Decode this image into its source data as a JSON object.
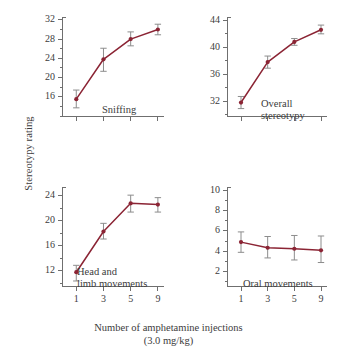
{
  "figure": {
    "shared_xlabel_line1": "Number of amphetamine injections",
    "shared_xlabel_line2": "(3.0 mg/kg)",
    "shared_ylabel": "Stereotypy rating",
    "background": "#ffffff",
    "series_color": "#8b2434",
    "errorbar_color": "#8c8c8c",
    "axis_color": "#6f6f6f"
  },
  "chart_data": [
    {
      "type": "line",
      "title": "Sniffing",
      "panel": "top-left",
      "xlabel": "Number of amphetamine injections (3.0 mg/kg)",
      "ylabel": "Stereotypy rating",
      "x": [
        1,
        3,
        5,
        9
      ],
      "categories": [
        "1",
        "3",
        "5",
        "9"
      ],
      "xtick_labels_visible": false,
      "values": [
        15.5,
        23.8,
        28.0,
        30.0
      ],
      "errors_upper": [
        1.9,
        2.3,
        1.5,
        1.1
      ],
      "errors_lower": [
        1.8,
        2.5,
        1.4,
        1.1
      ],
      "ylim": [
        12.0,
        32.6
      ],
      "yticks": [
        16,
        20,
        24,
        28,
        32
      ],
      "yminor_step": 2,
      "grid": false,
      "legend": "none",
      "marker": "filled-circle"
    },
    {
      "type": "line",
      "title": "Overall stereotypy",
      "title_line1": "Overall",
      "title_line2": "stereotypy",
      "panel": "top-right",
      "xlabel": "Number of amphetamine injections (3.0 mg/kg)",
      "ylabel": "Stereotypy rating",
      "x": [
        1,
        3,
        5,
        9
      ],
      "categories": [
        "1",
        "3",
        "5",
        "9"
      ],
      "xtick_labels_visible": false,
      "values": [
        31.8,
        37.8,
        40.8,
        42.6
      ],
      "errors_upper": [
        0.9,
        0.9,
        0.5,
        0.7
      ],
      "errors_lower": [
        0.9,
        0.9,
        0.5,
        0.6
      ],
      "ylim": [
        29.8,
        44.5
      ],
      "yticks": [
        32,
        36,
        40,
        44
      ],
      "yminor_step": 2,
      "grid": false,
      "legend": "none",
      "marker": "filled-circle"
    },
    {
      "type": "line",
      "title": "Head and limb movements",
      "title_line1": "Head and",
      "title_line2": "limb movements",
      "panel": "bottom-left",
      "xlabel": "Number of amphetamine injections (3.0 mg/kg)",
      "ylabel": "Stereotypy rating",
      "x": [
        1,
        3,
        5,
        9
      ],
      "categories": [
        "1",
        "3",
        "5",
        "9"
      ],
      "xtick_labels_visible": true,
      "values": [
        11.8,
        18.3,
        22.8,
        22.6
      ],
      "errors_upper": [
        1.1,
        1.3,
        1.3,
        1.1
      ],
      "errors_lower": [
        1.4,
        1.2,
        1.4,
        1.2
      ],
      "ylim": [
        9.6,
        25.4
      ],
      "yticks": [
        12,
        16,
        20,
        24
      ],
      "yminor_step": 2,
      "grid": false,
      "legend": "none",
      "marker": "filled-circle"
    },
    {
      "type": "line",
      "title": "Oral movements",
      "panel": "bottom-right",
      "xlabel": "Number of amphetamine injections (3.0 mg/kg)",
      "ylabel": "Stereotypy rating",
      "x": [
        1,
        3,
        5,
        9
      ],
      "categories": [
        "1",
        "3",
        "5",
        "9"
      ],
      "xtick_labels_visible": true,
      "values": [
        4.9,
        4.35,
        4.25,
        4.1
      ],
      "errors_upper": [
        1.0,
        1.1,
        1.3,
        1.4
      ],
      "errors_lower": [
        1.0,
        1.0,
        1.1,
        1.2
      ],
      "ylim": [
        0.6,
        10.3
      ],
      "yticks": [
        2,
        4,
        6,
        8,
        10
      ],
      "yminor_step": 1,
      "grid": false,
      "legend": "none",
      "marker": "filled-circle"
    }
  ]
}
